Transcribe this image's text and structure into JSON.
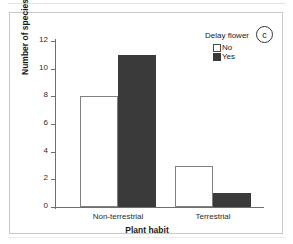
{
  "chart_data": {
    "type": "bar",
    "title": "",
    "panel_label": "c",
    "categories": [
      "Non-terrestrial",
      "Terrestrial"
    ],
    "series": [
      {
        "name": "No",
        "values": [
          8,
          3
        ]
      },
      {
        "name": "Yes",
        "values": [
          11,
          1
        ]
      }
    ],
    "xlabel": "Plant habit",
    "ylabel": "Number of species",
    "ylim": [
      0,
      12
    ],
    "yticks": [
      0,
      2,
      4,
      6,
      8,
      10,
      12
    ],
    "ytick_labels": [
      "0",
      "2",
      "4",
      "6",
      "8",
      "10",
      "12"
    ],
    "grid": false,
    "legend": {
      "title": "Delay flower",
      "position": "top-right",
      "entries": [
        {
          "label": "No",
          "color": "#ffffff",
          "edge": "#4a4a4a"
        },
        {
          "label": "Yes",
          "color": "#3a3a3a",
          "edge": "#3a3a3a"
        }
      ]
    }
  },
  "colors": {
    "bar_no_fill": "#ffffff",
    "bar_no_edge": "#808080",
    "bar_yes_fill": "#3a3a3a",
    "axis": "#6e6e6e",
    "text": "#1a1a1a",
    "panel_border": "#c9c9c9"
  }
}
